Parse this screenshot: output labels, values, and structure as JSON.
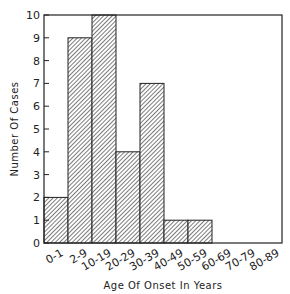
{
  "chart_data": {
    "type": "bar",
    "title": "",
    "xlabel": "Age Of Onset In Years",
    "ylabel": "Number Of Cases",
    "categories": [
      "0-1",
      "2-9",
      "10-19",
      "20-29",
      "30-39",
      "40-49",
      "50-59",
      "60-69",
      "70-79",
      "80-89"
    ],
    "values": [
      2,
      9,
      10,
      4,
      7,
      1,
      1,
      0,
      0,
      0
    ],
    "ylim": [
      0,
      10
    ],
    "yticks": [
      0,
      1,
      2,
      3,
      4,
      5,
      6,
      7,
      8,
      9,
      10
    ],
    "grid": false,
    "legend": null,
    "bar_fill": "diagonal-hatch",
    "colors": {
      "stroke": "#222222",
      "hatch": "#444444",
      "background": "#ffffff"
    }
  }
}
